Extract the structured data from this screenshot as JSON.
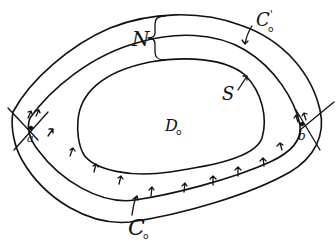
{
  "diagram": {
    "style": "hand-drawn black ink on white",
    "stroke_color": "#111111",
    "background": "#ffffff",
    "regions": {
      "inner_domain": "D₀",
      "band_label": "N"
    },
    "curves": {
      "inner_boundary": "S",
      "outer_top": "C₀'",
      "outer_bottom": "C₀"
    },
    "points": {
      "left": "a",
      "right": "b"
    },
    "labels": {
      "N": "N",
      "C0_prime": "C",
      "C0_prime_sub": "o",
      "C0_prime_mark": "'",
      "S": "S",
      "D0": "D",
      "D0_sub": "o",
      "a": "a",
      "b": "b",
      "C0": "C",
      "C0_sub": "o"
    },
    "arrow_count_bottom": 11
  }
}
